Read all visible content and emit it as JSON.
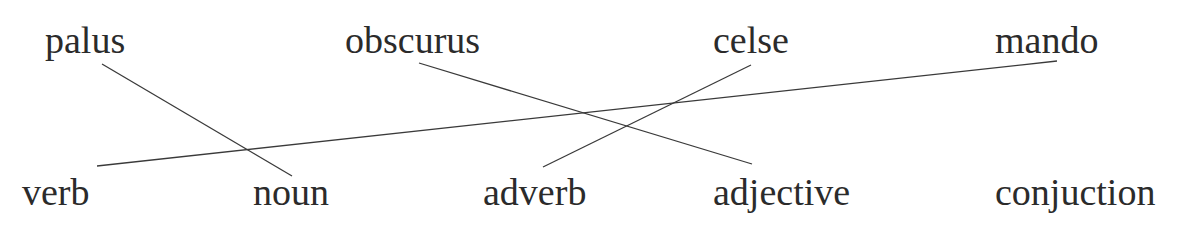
{
  "exercise": {
    "type": "matching",
    "top_words": [
      {
        "id": "palus",
        "label": "palus",
        "x": 45,
        "y": 53
      },
      {
        "id": "obscurus",
        "label": "obscurus",
        "x": 345,
        "y": 53
      },
      {
        "id": "celse",
        "label": "celse",
        "x": 713,
        "y": 53
      },
      {
        "id": "mando",
        "label": "mando",
        "x": 995,
        "y": 53
      }
    ],
    "bottom_words": [
      {
        "id": "verb",
        "label": "verb",
        "x": 22,
        "y": 205
      },
      {
        "id": "noun",
        "label": "noun",
        "x": 253,
        "y": 205
      },
      {
        "id": "adverb",
        "label": "adverb",
        "x": 483,
        "y": 205
      },
      {
        "id": "adjective",
        "label": "adjective",
        "x": 713,
        "y": 205
      },
      {
        "id": "conjuction",
        "label": "conjuction",
        "x": 995,
        "y": 205
      }
    ],
    "connections": [
      {
        "from": "palus",
        "to": "noun",
        "x1": 102,
        "y1": 64,
        "x2": 292,
        "y2": 176
      },
      {
        "from": "mando",
        "to": "verb",
        "x1": 1057,
        "y1": 61,
        "x2": 97,
        "y2": 166
      },
      {
        "from": "obscurus",
        "to": "adjective",
        "x1": 419,
        "y1": 63,
        "x2": 752,
        "y2": 164
      },
      {
        "from": "celse",
        "to": "adverb",
        "x1": 751,
        "y1": 65,
        "x2": 543,
        "y2": 167
      }
    ]
  },
  "colors": {
    "text": "#2b2b2b",
    "line": "#3a3a3a",
    "background": "#ffffff"
  }
}
